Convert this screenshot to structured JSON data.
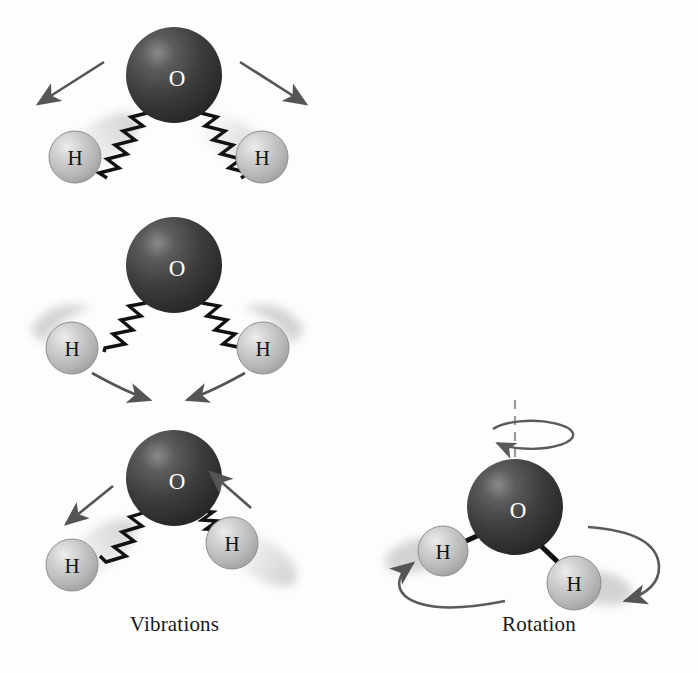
{
  "figure": {
    "background_color": "#fdfdfc"
  },
  "panels": [
    {
      "id": "vibrations",
      "caption": "Vibrations"
    },
    {
      "id": "rotation",
      "caption": "Rotation"
    }
  ],
  "atoms": {
    "oxygen_label": "O",
    "hydrogen_label": "H",
    "oxygen_color": "#3b3b3b",
    "oxygen_highlight_color": "#7d7d7d",
    "oxygen_label_color": "#ffffff",
    "hydrogen_color": "#b6b6b6",
    "hydrogen_highlight_color": "#e8e8e8",
    "hydrogen_label_color": "#141414",
    "blur_trail_color": "#cccccc"
  },
  "styles": {
    "spring_color": "#111111",
    "bond_color": "#111111",
    "arrow_color": "#555555",
    "axis_color": "#9a9a9a",
    "caption_color": "#1a1a1a"
  },
  "molecules": [
    {
      "id": "symmetric-stretch",
      "panel": "vibrations",
      "mode": "symmetric stretch",
      "bond_type": "spring",
      "arrow_type": "straight",
      "arrow_direction": "outward",
      "oxygen": {
        "cx": 174,
        "cy": 75,
        "r": 48
      },
      "hydrogens": [
        {
          "cx": 75,
          "cy": 157,
          "r": 26,
          "side": "left"
        },
        {
          "cx": 262,
          "cy": 157,
          "r": 26,
          "side": "right"
        }
      ]
    },
    {
      "id": "bending",
      "panel": "vibrations",
      "mode": "bend",
      "bond_type": "spring",
      "arrow_type": "curved",
      "arrow_direction": "inward",
      "oxygen": {
        "cx": 174,
        "cy": 265,
        "r": 48
      },
      "hydrogens": [
        {
          "cx": 72,
          "cy": 348,
          "r": 26,
          "side": "left"
        },
        {
          "cx": 263,
          "cy": 348,
          "r": 26,
          "side": "right"
        }
      ]
    },
    {
      "id": "asymmetric-stretch",
      "panel": "vibrations",
      "mode": "asymmetric stretch",
      "bond_type": "spring",
      "arrow_type": "straight",
      "arrow_direction": "left-out-right-in",
      "oxygen": {
        "cx": 174,
        "cy": 478,
        "r": 48
      },
      "hydrogens": [
        {
          "cx": 72,
          "cy": 565,
          "r": 26,
          "side": "left"
        },
        {
          "cx": 232,
          "cy": 543,
          "r": 26,
          "side": "right"
        }
      ]
    },
    {
      "id": "rotating-molecule",
      "panel": "rotation",
      "mode": "rotation about vertical axis",
      "bond_type": "straight",
      "arrow_type": "orbital",
      "oxygen": {
        "cx": 515,
        "cy": 507,
        "r": 48
      },
      "hydrogens": [
        {
          "cx": 443,
          "cy": 551,
          "r": 25,
          "side": "left"
        },
        {
          "cx": 574,
          "cy": 583,
          "r": 27,
          "side": "right"
        }
      ],
      "axis": {
        "x": 515,
        "y_top": 400,
        "y_bottom": 462,
        "style": "dashed"
      }
    }
  ]
}
